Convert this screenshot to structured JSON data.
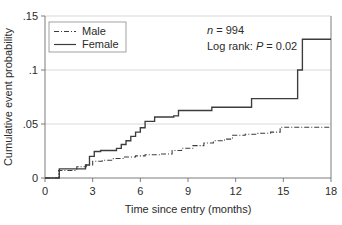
{
  "chart_data": {
    "type": "line",
    "subtype": "kaplan-meier-cumulative-incidence-step",
    "title": "",
    "xlabel": "Time since entry (months)",
    "ylabel": "Cumulative event probability",
    "xlim": [
      0,
      18
    ],
    "ylim": [
      0,
      0.15
    ],
    "xticks": [
      0,
      3,
      6,
      9,
      12,
      15,
      18
    ],
    "xtick_labels": [
      "0",
      "3",
      "6",
      "9",
      "12",
      "15",
      "18"
    ],
    "yticks": [
      0,
      0.05,
      0.1,
      0.15
    ],
    "ytick_labels": [
      "0",
      ".05",
      ".1",
      ".15"
    ],
    "grid": "horizontal-only",
    "legend_position": "top-left-inside",
    "series": [
      {
        "name": "Male",
        "style": "dash-dot",
        "color": "#3c3c3c",
        "points": [
          [
            0,
            0
          ],
          [
            0.85,
            0
          ],
          [
            0.85,
            0.007
          ],
          [
            2.0,
            0.007
          ],
          [
            2.0,
            0.0105
          ],
          [
            2.6,
            0.0105
          ],
          [
            2.6,
            0.012
          ],
          [
            3.0,
            0.012
          ],
          [
            3.0,
            0.0155
          ],
          [
            3.6,
            0.0155
          ],
          [
            3.6,
            0.0165
          ],
          [
            4.3,
            0.0165
          ],
          [
            4.3,
            0.018
          ],
          [
            5.0,
            0.018
          ],
          [
            5.0,
            0.0195
          ],
          [
            5.7,
            0.0195
          ],
          [
            5.7,
            0.0205
          ],
          [
            6.3,
            0.0205
          ],
          [
            6.3,
            0.0215
          ],
          [
            7.3,
            0.0215
          ],
          [
            7.3,
            0.0222
          ],
          [
            8.0,
            0.0222
          ],
          [
            8.0,
            0.0255
          ],
          [
            8.6,
            0.0255
          ],
          [
            8.6,
            0.0275
          ],
          [
            9.3,
            0.0275
          ],
          [
            9.3,
            0.03
          ],
          [
            10.0,
            0.03
          ],
          [
            10.0,
            0.0325
          ],
          [
            10.6,
            0.0325
          ],
          [
            10.6,
            0.0345
          ],
          [
            11.3,
            0.0345
          ],
          [
            11.3,
            0.036
          ],
          [
            11.8,
            0.036
          ],
          [
            11.8,
            0.0395
          ],
          [
            12.6,
            0.0395
          ],
          [
            12.6,
            0.0405
          ],
          [
            13.4,
            0.0405
          ],
          [
            13.4,
            0.0415
          ],
          [
            14.2,
            0.0415
          ],
          [
            14.2,
            0.0425
          ],
          [
            14.8,
            0.0425
          ],
          [
            14.8,
            0.047
          ],
          [
            18,
            0.047
          ]
        ]
      },
      {
        "name": "Female",
        "style": "solid",
        "color": "#3c3c3c",
        "points": [
          [
            0,
            0
          ],
          [
            0.9,
            0
          ],
          [
            0.9,
            0.0085
          ],
          [
            2.55,
            0.0085
          ],
          [
            2.55,
            0.012
          ],
          [
            2.8,
            0.012
          ],
          [
            2.8,
            0.02
          ],
          [
            3.1,
            0.02
          ],
          [
            3.1,
            0.0245
          ],
          [
            3.5,
            0.0245
          ],
          [
            3.5,
            0.0255
          ],
          [
            4.5,
            0.0255
          ],
          [
            4.5,
            0.0275
          ],
          [
            4.8,
            0.0275
          ],
          [
            4.8,
            0.031
          ],
          [
            5.1,
            0.031
          ],
          [
            5.1,
            0.0345
          ],
          [
            5.4,
            0.0345
          ],
          [
            5.4,
            0.0385
          ],
          [
            5.7,
            0.0385
          ],
          [
            5.7,
            0.0425
          ],
          [
            6.0,
            0.0425
          ],
          [
            6.0,
            0.0465
          ],
          [
            6.3,
            0.0465
          ],
          [
            6.3,
            0.0525
          ],
          [
            6.9,
            0.0525
          ],
          [
            6.9,
            0.0565
          ],
          [
            8.1,
            0.0565
          ],
          [
            8.1,
            0.0575
          ],
          [
            8.4,
            0.0575
          ],
          [
            8.4,
            0.0625
          ],
          [
            10.5,
            0.0625
          ],
          [
            10.5,
            0.0655
          ],
          [
            13.0,
            0.0655
          ],
          [
            13.0,
            0.0735
          ],
          [
            15.9,
            0.0735
          ],
          [
            15.9,
            0.1
          ],
          [
            16.2,
            0.1
          ],
          [
            16.2,
            0.1285
          ],
          [
            18,
            0.1285
          ]
        ]
      }
    ],
    "annotations": [
      {
        "name": "sample-size",
        "prefix_italic": "n",
        "text": " = 994"
      },
      {
        "name": "log-rank-test",
        "text_before": "Log rank: ",
        "italic": "P",
        "text_after": " = 0.02"
      }
    ]
  },
  "legend": {
    "items": [
      {
        "label": "Male",
        "style": "dash-dot"
      },
      {
        "label": "Female",
        "style": "solid"
      }
    ]
  },
  "axes": {
    "x_title": "Time since entry (months)",
    "y_title": "Cumulative event probability"
  },
  "colors": {
    "line": "#3c3c3c",
    "axis": "#6e6e6e",
    "grid": "#c9c9c9",
    "background": "#ffffff",
    "text": "#2b2b2b"
  }
}
